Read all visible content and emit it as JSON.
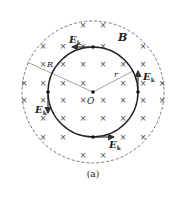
{
  "figure": {
    "caption": "(a)",
    "field_label": "B",
    "center_label": "O",
    "outer_radius_label": "R",
    "inner_radius_label": "r",
    "field_vector_label": "E",
    "field_vector_subscript": "k",
    "field_symbol": "×",
    "colors": {
      "stroke": "#222222",
      "dashed": "#555555",
      "radius_line": "#888888"
    }
  }
}
